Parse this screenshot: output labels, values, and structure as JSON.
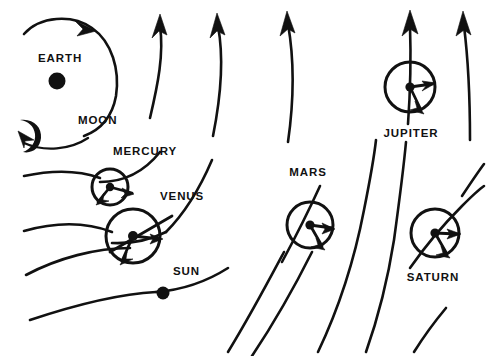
{
  "figure": {
    "kind": "astronomical-orbit-diagram",
    "background_color": "#ffffff",
    "ink_color": "#111111",
    "width": 486,
    "height": 356
  },
  "labels": {
    "earth": "EARTH",
    "moon": "MOON",
    "mercury": "MERCURY",
    "venus": "VENUS",
    "sun": "SUN",
    "mars": "MARS",
    "jupiter": "JUPITER",
    "saturn": "SATURN"
  },
  "label_positions": {
    "earth": {
      "x": 38,
      "y": 62
    },
    "moon": {
      "x": 78,
      "y": 124
    },
    "mercury": {
      "x": 113,
      "y": 155
    },
    "venus": {
      "x": 160,
      "y": 200
    },
    "sun": {
      "x": 173,
      "y": 275
    },
    "mars": {
      "x": 308,
      "y": 176
    },
    "jupiter": {
      "x": 411,
      "y": 137
    },
    "saturn": {
      "x": 433,
      "y": 281
    }
  },
  "bodies": [
    {
      "name": "earth",
      "type": "filled-dot",
      "cx": 57,
      "cy": 81,
      "r": 8.5
    },
    {
      "name": "moon",
      "type": "crescent",
      "cx": 27,
      "cy": 130,
      "r": 11
    },
    {
      "name": "mercury",
      "type": "orbit-circle",
      "cx": 110,
      "cy": 187,
      "r": 18
    },
    {
      "name": "venus",
      "type": "orbit-circle",
      "cx": 133,
      "cy": 236,
      "r": 27
    },
    {
      "name": "sun",
      "type": "filled-dot",
      "cx": 163,
      "cy": 293,
      "r": 6.5
    },
    {
      "name": "mars",
      "type": "orbit-circle",
      "cx": 310,
      "cy": 225,
      "r": 23
    },
    {
      "name": "jupiter",
      "type": "orbit-circle",
      "cx": 410,
      "cy": 87,
      "r": 25
    },
    {
      "name": "saturn",
      "type": "orbit-circle",
      "cx": 435,
      "cy": 233,
      "r": 24
    }
  ],
  "orbit_arcs": {
    "count": 8,
    "description": "Concentric arcs sweeping up-right, each carrying an arrowhead at its leading end."
  }
}
